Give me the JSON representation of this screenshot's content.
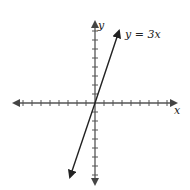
{
  "chart_data": {
    "type": "line",
    "title": "",
    "equation_label": "y = 3x",
    "xlabel": "x",
    "ylabel": "y",
    "series": [
      {
        "name": "y = 3x",
        "points": [
          [
            -0.9,
            -2.7
          ],
          [
            0.9,
            2.7
          ]
        ]
      }
    ],
    "x_ticks_each_side": 8,
    "y_ticks_each_side": 8,
    "grid": false
  },
  "labels": {
    "x_axis": "x",
    "y_axis": "y",
    "line": "y = 3x"
  }
}
